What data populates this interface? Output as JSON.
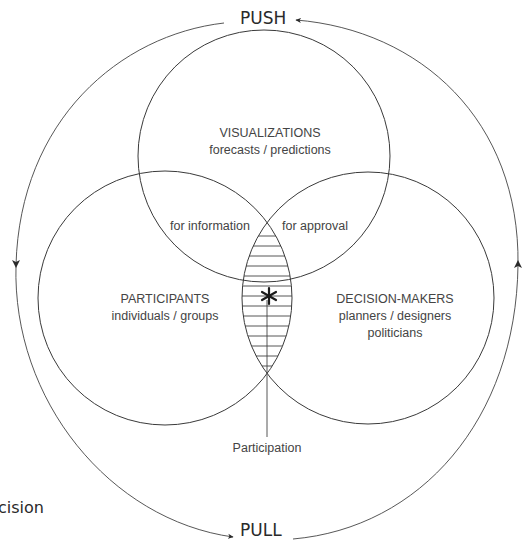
{
  "diagram": {
    "cycle": {
      "top_label": "PUSH",
      "bottom_label": "PULL"
    },
    "circles": [
      {
        "id": "visualizations",
        "title": "VISUALIZATIONS",
        "subtitle": "forecasts / predictions"
      },
      {
        "id": "participants",
        "title": "PARTICIPANTS",
        "subtitle": "individuals / groups"
      },
      {
        "id": "decision_makers",
        "title": "DECISION-MAKERS",
        "subtitle": "planners / designers",
        "subtitle2": "politicians"
      }
    ],
    "overlaps": {
      "left": "for information",
      "right": "for approval"
    },
    "center": {
      "marker": "✱",
      "label": "Participation"
    },
    "clipped_text": "cision",
    "colors": {
      "line": "#3a3a3a",
      "text": "#444444",
      "background": "#ffffff"
    }
  }
}
